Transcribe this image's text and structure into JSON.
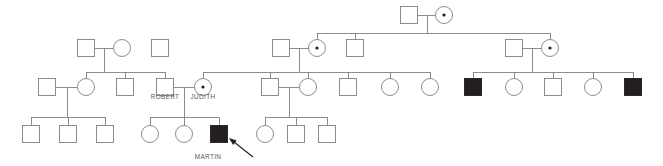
{
  "chart_title": "Family pedigree chart",
  "legend": {
    "unaffected_male": "open square",
    "unaffected_female": "open circle",
    "affected_male": "filled square",
    "carrier_female": "circle with central dot",
    "proband_marker": "arrow"
  },
  "colors": {
    "stroke": "#808184",
    "affected_fill": "#231f20",
    "carrier_dot": "#231f20",
    "label_text": "#58585a",
    "background": "#ffffff",
    "arrow": "#231f20"
  },
  "labels": [
    {
      "id": "robert",
      "text": "ROBERT",
      "x": 165,
      "y": 99,
      "anchor": "middle"
    },
    {
      "id": "judith",
      "text": "JUDITH",
      "x": 203,
      "y": 99,
      "anchor": "middle"
    },
    {
      "id": "martin",
      "text": "MARTIN",
      "x": 208,
      "y": 159,
      "anchor": "middle"
    }
  ],
  "generations": [
    {
      "id": "generation-1",
      "number": 1,
      "y": 15,
      "individuals": [
        {
          "id": "I-1",
          "sex": "male",
          "shape": "square",
          "status": "unaffected",
          "cx": 409,
          "cy": 15,
          "label": null
        },
        {
          "id": "I-2",
          "sex": "female",
          "shape": "circle",
          "status": "carrier",
          "cx": 444,
          "cy": 15,
          "label": null
        }
      ]
    },
    {
      "id": "generation-2",
      "number": 2,
      "y": 48,
      "individuals": [
        {
          "id": "II-1",
          "sex": "male",
          "shape": "square",
          "status": "unaffected",
          "cx": 86,
          "cy": 48,
          "label": null
        },
        {
          "id": "II-2",
          "sex": "female",
          "shape": "circle",
          "status": "unaffected",
          "cx": 122,
          "cy": 48,
          "label": null
        },
        {
          "id": "II-3",
          "sex": "male",
          "shape": "square",
          "status": "unaffected",
          "cx": 160,
          "cy": 48,
          "label": null
        },
        {
          "id": "II-4",
          "sex": "male",
          "shape": "square",
          "status": "unaffected",
          "cx": 281,
          "cy": 48,
          "label": null
        },
        {
          "id": "II-5",
          "sex": "female",
          "shape": "circle",
          "status": "carrier",
          "cx": 317,
          "cy": 48,
          "label": null
        },
        {
          "id": "II-6",
          "sex": "male",
          "shape": "square",
          "status": "unaffected",
          "cx": 355,
          "cy": 48,
          "label": null
        },
        {
          "id": "II-7",
          "sex": "male",
          "shape": "square",
          "status": "unaffected",
          "cx": 514,
          "cy": 48,
          "label": null
        },
        {
          "id": "II-8",
          "sex": "female",
          "shape": "circle",
          "status": "carrier",
          "cx": 550,
          "cy": 48,
          "label": null
        }
      ]
    },
    {
      "id": "generation-3",
      "number": 3,
      "y": 87,
      "individuals": [
        {
          "id": "III-1",
          "sex": "male",
          "shape": "square",
          "status": "unaffected",
          "cx": 47,
          "cy": 87,
          "label": null
        },
        {
          "id": "III-2",
          "sex": "female",
          "shape": "circle",
          "status": "unaffected",
          "cx": 86,
          "cy": 87,
          "label": null
        },
        {
          "id": "III-3",
          "sex": "male",
          "shape": "square",
          "status": "unaffected",
          "cx": 125,
          "cy": 87,
          "label": null
        },
        {
          "id": "III-4",
          "sex": "male",
          "shape": "square",
          "status": "unaffected",
          "cx": 165,
          "cy": 87,
          "label": "ROBERT"
        },
        {
          "id": "III-5",
          "sex": "female",
          "shape": "circle",
          "status": "carrier",
          "cx": 203,
          "cy": 87,
          "label": "JUDITH"
        },
        {
          "id": "III-6",
          "sex": "male",
          "shape": "square",
          "status": "unaffected",
          "cx": 270,
          "cy": 87,
          "label": null
        },
        {
          "id": "III-7",
          "sex": "female",
          "shape": "circle",
          "status": "unaffected",
          "cx": 308,
          "cy": 87,
          "label": null
        },
        {
          "id": "III-8",
          "sex": "male",
          "shape": "square",
          "status": "unaffected",
          "cx": 348,
          "cy": 87,
          "label": null
        },
        {
          "id": "III-9",
          "sex": "female",
          "shape": "circle",
          "status": "unaffected",
          "cx": 390,
          "cy": 87,
          "label": null
        },
        {
          "id": "III-10",
          "sex": "female",
          "shape": "circle",
          "status": "unaffected",
          "cx": 430,
          "cy": 87,
          "label": null
        },
        {
          "id": "III-11",
          "sex": "male",
          "shape": "square",
          "status": "affected",
          "cx": 473,
          "cy": 87,
          "label": null
        },
        {
          "id": "III-12",
          "sex": "female",
          "shape": "circle",
          "status": "unaffected",
          "cx": 514,
          "cy": 87,
          "label": null
        },
        {
          "id": "III-13",
          "sex": "male",
          "shape": "square",
          "status": "unaffected",
          "cx": 553,
          "cy": 87,
          "label": null
        },
        {
          "id": "III-14",
          "sex": "female",
          "shape": "circle",
          "status": "unaffected",
          "cx": 593,
          "cy": 87,
          "label": null
        },
        {
          "id": "III-15",
          "sex": "male",
          "shape": "square",
          "status": "affected",
          "cx": 633,
          "cy": 87,
          "label": null
        }
      ]
    },
    {
      "id": "generation-4",
      "number": 4,
      "y": 134,
      "individuals": [
        {
          "id": "IV-1",
          "sex": "male",
          "shape": "square",
          "status": "unaffected",
          "cx": 31,
          "cy": 134,
          "label": null
        },
        {
          "id": "IV-2",
          "sex": "male",
          "shape": "square",
          "status": "unaffected",
          "cx": 68,
          "cy": 134,
          "label": null
        },
        {
          "id": "IV-3",
          "sex": "male",
          "shape": "square",
          "status": "unaffected",
          "cx": 105,
          "cy": 134,
          "label": null
        },
        {
          "id": "IV-4",
          "sex": "female",
          "shape": "circle",
          "status": "unaffected",
          "cx": 150,
          "cy": 134,
          "label": null
        },
        {
          "id": "IV-5",
          "sex": "female",
          "shape": "circle",
          "status": "unaffected",
          "cx": 184,
          "cy": 134,
          "label": null
        },
        {
          "id": "IV-6",
          "sex": "male",
          "shape": "square",
          "status": "affected",
          "cx": 219,
          "cy": 134,
          "label": "MARTIN"
        },
        {
          "id": "IV-7",
          "sex": "female",
          "shape": "circle",
          "status": "unaffected",
          "cx": 265,
          "cy": 134,
          "label": null
        },
        {
          "id": "IV-8",
          "sex": "male",
          "shape": "square",
          "status": "unaffected",
          "cx": 296,
          "cy": 134,
          "label": null
        },
        {
          "id": "IV-9",
          "sex": "male",
          "shape": "square",
          "status": "unaffected",
          "cx": 327,
          "cy": 134,
          "label": null
        }
      ]
    }
  ],
  "unions": [
    {
      "id": "union-I",
      "left": "I-1",
      "right": "I-2",
      "y": 15,
      "x1": 418,
      "x2": 435,
      "drop_x": 427,
      "drop_to": 33
    },
    {
      "id": "union-II-left",
      "left": "II-1",
      "right": "II-2",
      "y": 48,
      "x1": 95,
      "x2": 113,
      "drop_x": 104,
      "drop_to": 72
    },
    {
      "id": "union-II-mid",
      "left": "II-4",
      "right": "II-5",
      "y": 48,
      "x1": 290,
      "x2": 308,
      "drop_x": 299,
      "drop_to": 72
    },
    {
      "id": "union-II-right",
      "left": "II-7",
      "right": "II-8",
      "y": 48,
      "x1": 523,
      "x2": 541,
      "drop_x": 532,
      "drop_to": 72
    },
    {
      "id": "union-III-left",
      "left": "III-1",
      "right": "III-2",
      "y": 87,
      "x1": 56,
      "x2": 77,
      "drop_x": 67,
      "drop_to": 117
    },
    {
      "id": "union-III-robert-judith",
      "left": "III-4",
      "right": "III-5",
      "y": 87,
      "x1": 174,
      "x2": 194,
      "drop_x": 184,
      "drop_to": 117
    },
    {
      "id": "union-III-mid",
      "left": "III-6",
      "right": "III-7",
      "y": 87,
      "x1": 279,
      "x2": 299,
      "drop_x": 289,
      "drop_to": 117
    }
  ],
  "sibships": [
    {
      "id": "sibship-gen2",
      "parent_union": "union-I",
      "bar_y": 33,
      "x1": 317,
      "x2": 550,
      "children_x": [
        317,
        355,
        550
      ],
      "child_top": 40
    },
    {
      "id": "sibship-gen3-left",
      "parent_union": "union-II-left",
      "bar_y": 72,
      "x1": 86,
      "x2": 165,
      "children_x": [
        86,
        125,
        165
      ],
      "child_top": 79
    },
    {
      "id": "sibship-gen3-mid",
      "parent_union": "union-II-mid",
      "bar_y": 72,
      "x1": 203,
      "x2": 430,
      "children_x": [
        203,
        270,
        308,
        348,
        390,
        430
      ],
      "child_top": 79
    },
    {
      "id": "sibship-gen3-right",
      "parent_union": "union-II-right",
      "bar_y": 72,
      "x1": 473,
      "x2": 633,
      "children_x": [
        473,
        514,
        553,
        593,
        633
      ],
      "child_top": 79
    },
    {
      "id": "sibship-gen4-left",
      "parent_union": "union-III-left",
      "bar_y": 117,
      "x1": 31,
      "x2": 105,
      "children_x": [
        31,
        68,
        105
      ],
      "child_top": 126
    },
    {
      "id": "sibship-gen4-martin",
      "parent_union": "union-III-robert-judith",
      "bar_y": 117,
      "x1": 150,
      "x2": 219,
      "children_x": [
        150,
        184,
        219
      ],
      "child_top": 126
    },
    {
      "id": "sibship-gen4-mid",
      "parent_union": "union-III-mid",
      "bar_y": 117,
      "x1": 265,
      "x2": 327,
      "children_x": [
        265,
        296,
        327
      ],
      "child_top": 126
    }
  ],
  "proband_arrow": {
    "id": "proband-arrow",
    "points_to": "IV-6",
    "tail_x": 253,
    "tail_y": 157,
    "head_x": 229,
    "head_y": 138
  },
  "geometry": {
    "square_size": 17,
    "circle_radius": 8.5,
    "carrier_dot_radius": 1.6,
    "stroke_width": 0.9
  }
}
